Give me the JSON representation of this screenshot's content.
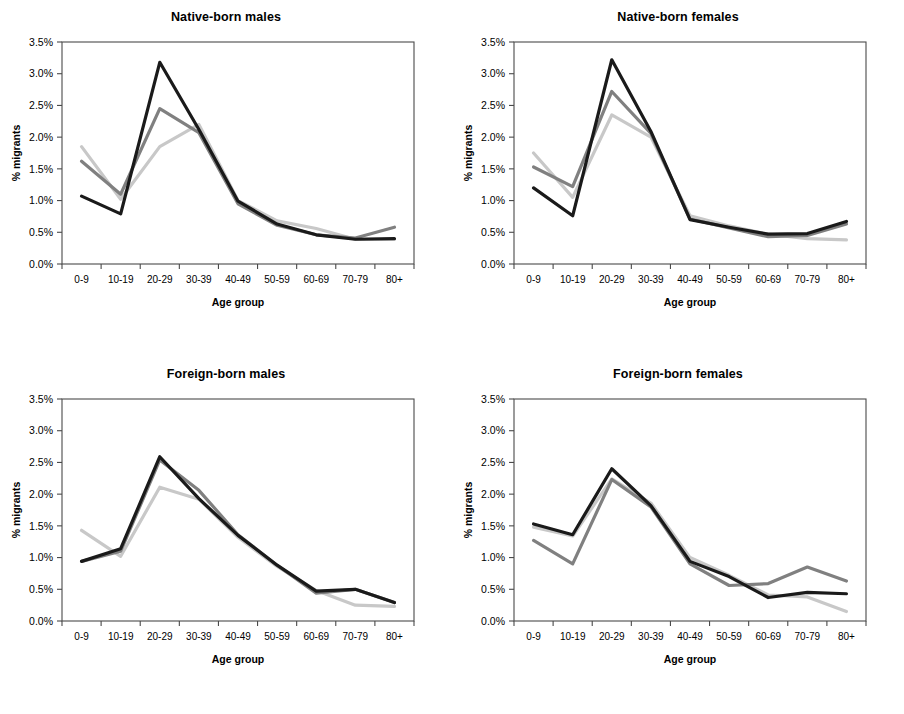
{
  "figure": {
    "panel_count": 4,
    "axis_titles": {
      "x": "Age group",
      "y": "% migrants"
    },
    "y_ticks": [
      "0.0%",
      "0.5%",
      "1.0%",
      "1.5%",
      "2.0%",
      "2.5%",
      "3.0%",
      "3.5%"
    ],
    "categories": [
      "0-9",
      "10-19",
      "20-29",
      "30-39",
      "40-49",
      "50-59",
      "60-69",
      "70-79",
      "80+"
    ],
    "series_colors": {
      "dark": "#1a1a1a",
      "mid": "#808080",
      "light": "#c8c8c8"
    },
    "panels": [
      {
        "title": "Native-born males"
      },
      {
        "title": "Native-born females"
      },
      {
        "title": "Foreign-born males"
      },
      {
        "title": "Foreign-born females"
      }
    ]
  },
  "chart_data": [
    {
      "type": "line",
      "title": "Native-born males",
      "xlabel": "Age group",
      "ylabel": "% migrants",
      "categories": [
        "0-9",
        "10-19",
        "20-29",
        "30-39",
        "40-49",
        "50-59",
        "60-69",
        "70-79",
        "80+"
      ],
      "ylim": [
        0.0,
        3.5
      ],
      "ytick_values": [
        0.0,
        0.5,
        1.0,
        1.5,
        2.0,
        2.5,
        3.0,
        3.5
      ],
      "grid": false,
      "legend": "none",
      "series": [
        {
          "name": "dark",
          "color": "#1a1a1a",
          "values": [
            1.07,
            0.79,
            3.18,
            2.12,
            0.99,
            0.63,
            0.46,
            0.39,
            0.4
          ]
        },
        {
          "name": "mid",
          "color": "#808080",
          "values": [
            1.62,
            1.1,
            2.45,
            2.07,
            0.95,
            0.61,
            0.46,
            0.41,
            0.58
          ]
        },
        {
          "name": "light",
          "color": "#c8c8c8",
          "values": [
            1.85,
            1.02,
            1.85,
            2.2,
            1.0,
            0.68,
            0.56,
            0.39,
            0.39
          ]
        }
      ]
    },
    {
      "type": "line",
      "title": "Native-born females",
      "xlabel": "Age group",
      "ylabel": "% migrants",
      "categories": [
        "0-9",
        "10-19",
        "20-29",
        "30-39",
        "40-49",
        "50-59",
        "60-69",
        "70-79",
        "80+"
      ],
      "ylim": [
        0.0,
        3.5
      ],
      "ytick_values": [
        0.0,
        0.5,
        1.0,
        1.5,
        2.0,
        2.5,
        3.0,
        3.5
      ],
      "grid": false,
      "legend": "none",
      "series": [
        {
          "name": "dark",
          "color": "#1a1a1a",
          "values": [
            1.2,
            0.76,
            3.22,
            2.09,
            0.7,
            0.58,
            0.47,
            0.48,
            0.67
          ]
        },
        {
          "name": "mid",
          "color": "#808080",
          "values": [
            1.53,
            1.22,
            2.72,
            2.06,
            0.71,
            0.57,
            0.43,
            0.45,
            0.63
          ]
        },
        {
          "name": "light",
          "color": "#c8c8c8",
          "values": [
            1.75,
            1.05,
            2.35,
            2.0,
            0.76,
            0.6,
            0.47,
            0.4,
            0.38
          ]
        }
      ]
    },
    {
      "type": "line",
      "title": "Foreign-born males",
      "xlabel": "Age group",
      "ylabel": "% migrants",
      "categories": [
        "0-9",
        "10-19",
        "20-29",
        "30-39",
        "40-49",
        "50-59",
        "60-69",
        "70-79",
        "80+"
      ],
      "ylim": [
        0.0,
        3.5
      ],
      "ytick_values": [
        0.0,
        0.5,
        1.0,
        1.5,
        2.0,
        2.5,
        3.0,
        3.5
      ],
      "grid": false,
      "legend": "none",
      "series": [
        {
          "name": "dark",
          "color": "#1a1a1a",
          "values": [
            0.94,
            1.14,
            2.59,
            1.93,
            1.35,
            0.88,
            0.47,
            0.5,
            0.29
          ]
        },
        {
          "name": "mid",
          "color": "#808080",
          "values": [
            0.94,
            1.1,
            2.54,
            2.06,
            1.36,
            0.88,
            0.44,
            0.5,
            0.29
          ]
        },
        {
          "name": "light",
          "color": "#c8c8c8",
          "values": [
            1.43,
            1.02,
            2.11,
            1.92,
            1.32,
            0.86,
            0.48,
            0.25,
            0.23
          ]
        }
      ]
    },
    {
      "type": "line",
      "title": "Foreign-born females",
      "xlabel": "Age group",
      "ylabel": "% migrants",
      "categories": [
        "0-9",
        "10-19",
        "20-29",
        "30-39",
        "40-49",
        "50-59",
        "60-69",
        "70-79",
        "80+"
      ],
      "ylim": [
        0.0,
        3.5
      ],
      "ytick_values": [
        0.0,
        0.5,
        1.0,
        1.5,
        2.0,
        2.5,
        3.0,
        3.5
      ],
      "grid": false,
      "legend": "none",
      "series": [
        {
          "name": "dark",
          "color": "#1a1a1a",
          "values": [
            1.53,
            1.36,
            2.4,
            1.82,
            0.94,
            0.7,
            0.37,
            0.45,
            0.43
          ]
        },
        {
          "name": "mid",
          "color": "#808080",
          "values": [
            1.27,
            0.9,
            2.23,
            1.8,
            0.9,
            0.56,
            0.59,
            0.85,
            0.63
          ]
        },
        {
          "name": "light",
          "color": "#c8c8c8",
          "values": [
            1.48,
            1.34,
            2.24,
            1.86,
            1.0,
            0.72,
            0.41,
            0.38,
            0.15
          ]
        }
      ]
    }
  ]
}
